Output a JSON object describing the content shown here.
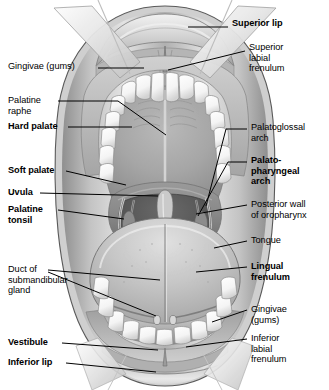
{
  "figure": {
    "width": 329,
    "height": 390,
    "background_color": "#ffffff",
    "ink_color": "#000000"
  },
  "labels": {
    "superior_lip": {
      "text": "Superior lip",
      "bold": true,
      "x": 232,
      "y": 22,
      "align": "left"
    },
    "superior_labial_frenulum": {
      "text": "Superior\nlabial\nfrenulum",
      "bold": false,
      "x": 249,
      "y": 46,
      "align": "left"
    },
    "gingivae_gums_upper": {
      "text": "Gingivae (gums)",
      "bold": false,
      "x": 8,
      "y": 63,
      "align": "left"
    },
    "palatine_raphe": {
      "text": "Palatine\nraphe",
      "bold": false,
      "x": 8,
      "y": 96,
      "align": "left"
    },
    "hard_palate": {
      "text": "Hard palate",
      "bold": true,
      "x": 8,
      "y": 122,
      "align": "left"
    },
    "palatoglossal_arch": {
      "text": "Palatoglossal\narch",
      "bold": false,
      "x": 251,
      "y": 124,
      "align": "left"
    },
    "palatopharyngeal_arch": {
      "text": "Palato-\npharyngeal\narch",
      "bold": true,
      "x": 251,
      "y": 156,
      "align": "left"
    },
    "soft_palate": {
      "text": "Soft palate",
      "bold": true,
      "x": 8,
      "y": 166,
      "align": "left"
    },
    "uvula": {
      "text": "Uvula",
      "bold": true,
      "x": 8,
      "y": 188,
      "align": "left"
    },
    "palatine_tonsil": {
      "text": "Palatine\ntonsil",
      "bold": true,
      "x": 8,
      "y": 205,
      "align": "left"
    },
    "posterior_wall": {
      "text": "Posterior wall\nof oropharynx",
      "bold": false,
      "x": 251,
      "y": 200,
      "align": "left"
    },
    "tongue": {
      "text": "Tongue",
      "bold": false,
      "x": 251,
      "y": 236,
      "align": "left"
    },
    "duct_submandibular": {
      "text": "Duct of\nsubmandibular\ngland",
      "bold": false,
      "x": 8,
      "y": 265,
      "align": "left"
    },
    "lingual_frenulum": {
      "text": "Lingual\nfrenulum",
      "bold": true,
      "x": 251,
      "y": 262,
      "align": "left"
    },
    "gingivae_gums_lower": {
      "text": "Gingivae\n(gums)",
      "bold": false,
      "x": 251,
      "y": 305,
      "align": "left"
    },
    "inferior_labial_frenulum": {
      "text": "Inferior\nlabial\nfrenulum",
      "bold": false,
      "x": 251,
      "y": 334,
      "align": "left"
    },
    "vestibule": {
      "text": "Vestibule",
      "bold": true,
      "x": 8,
      "y": 338,
      "align": "left"
    },
    "inferior_lip": {
      "text": "Inferior lip",
      "bold": true,
      "x": 8,
      "y": 358,
      "align": "left"
    }
  },
  "structures": [
    {
      "name": "superior-lip",
      "label_key": "superior_lip"
    },
    {
      "name": "superior-labial-frenulum",
      "label_key": "superior_labial_frenulum"
    },
    {
      "name": "upper-gingivae",
      "label_key": "gingivae_gums_upper"
    },
    {
      "name": "palatine-raphe",
      "label_key": "palatine_raphe"
    },
    {
      "name": "hard-palate",
      "label_key": "hard_palate"
    },
    {
      "name": "palatoglossal-arch",
      "label_key": "palatoglossal_arch"
    },
    {
      "name": "palatopharyngeal-arch",
      "label_key": "palatopharyngeal_arch"
    },
    {
      "name": "soft-palate",
      "label_key": "soft_palate"
    },
    {
      "name": "uvula",
      "label_key": "uvula"
    },
    {
      "name": "palatine-tonsil",
      "label_key": "palatine_tonsil"
    },
    {
      "name": "posterior-wall-oropharynx",
      "label_key": "posterior_wall"
    },
    {
      "name": "tongue",
      "label_key": "tongue"
    },
    {
      "name": "submandibular-duct",
      "label_key": "duct_submandibular"
    },
    {
      "name": "lingual-frenulum",
      "label_key": "lingual_frenulum"
    },
    {
      "name": "lower-gingivae",
      "label_key": "gingivae_gums_lower"
    },
    {
      "name": "inferior-labial-frenulum",
      "label_key": "inferior_labial_frenulum"
    },
    {
      "name": "vestibule",
      "label_key": "vestibule"
    },
    {
      "name": "inferior-lip",
      "label_key": "inferior_lip"
    }
  ]
}
